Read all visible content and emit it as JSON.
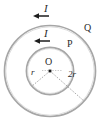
{
  "figure": {
    "background_color": "#ffffff",
    "stroke_color": "#9a9a9a",
    "label_color": "#2b2b2b",
    "center": {
      "label": "O",
      "x": 50,
      "y": 71
    },
    "circles": [
      {
        "name": "inner-loop",
        "radius_label": "r",
        "radius_px": 24,
        "current_label": "I",
        "current_direction": "counterclockwise"
      },
      {
        "name": "outer-loop",
        "radius_label": "2r",
        "radius_px": 46,
        "current_label": "I",
        "current_direction": "counterclockwise"
      }
    ],
    "points": [
      {
        "name": "point-p",
        "label": "P",
        "on": "inner-loop"
      },
      {
        "name": "point-q",
        "label": "Q",
        "on": "outer-loop"
      }
    ],
    "labels": {
      "current_outer": "I",
      "current_inner": "I",
      "point_q": "Q",
      "point_p": "P",
      "center_o": "O",
      "radius_inner": "r",
      "radius_outer": "2r"
    }
  }
}
